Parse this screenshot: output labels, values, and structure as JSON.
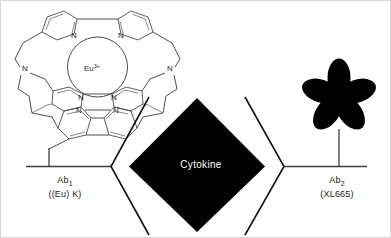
{
  "figure": {
    "background_color": "#ffffff",
    "ink_color": "#000000"
  },
  "donor": {
    "complex_name": "europium-cryptate",
    "metal_label": "Eu",
    "metal_charge": "3+",
    "nitrogen_label": "N",
    "nitrogen_count": 8,
    "antibody_label": "Ab",
    "antibody_index": "1",
    "antibody_tag": "((Eu) K)"
  },
  "analyte": {
    "label": "Cytokine",
    "shape": "diamond",
    "fill_color": "#000000",
    "text_color": "#ffffff"
  },
  "acceptor": {
    "fluorophore_shape": "five-petal-flower",
    "fill_color": "#000000",
    "antibody_label": "Ab",
    "antibody_index": "2",
    "antibody_tag": "(XL665)"
  }
}
